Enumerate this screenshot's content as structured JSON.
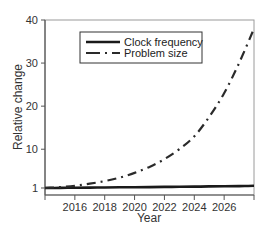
{
  "chart_data": {
    "type": "line",
    "title": "",
    "xlabel": "Year",
    "ylabel": "Relative change",
    "xlim": [
      2014,
      2028
    ],
    "ylim": [
      0,
      40
    ],
    "x_ticks": [
      "2016",
      "2018",
      "2020",
      "2022",
      "2024",
      "2026"
    ],
    "y_ticks": [
      "1",
      "10",
      "20",
      "30",
      "40"
    ],
    "grid": false,
    "legend_position": "upper left (inside)",
    "x": [
      2014,
      2015,
      2016,
      2017,
      2018,
      2019,
      2020,
      2021,
      2022,
      2023,
      2024,
      2025,
      2026,
      2027,
      2028
    ],
    "series": [
      {
        "name": "Clock frequency",
        "style": "solid",
        "values": [
          1.0,
          1.03,
          1.06,
          1.09,
          1.12,
          1.15,
          1.18,
          1.21,
          1.25,
          1.28,
          1.32,
          1.36,
          1.4,
          1.45,
          1.5
        ]
      },
      {
        "name": "Problem size",
        "style": "dash-dot",
        "values": [
          1.0,
          1.2,
          1.5,
          2.0,
          2.6,
          3.4,
          4.5,
          5.9,
          7.7,
          10.0,
          13.0,
          17.5,
          23.0,
          30.0,
          38.0
        ]
      }
    ]
  },
  "legend": {
    "items": [
      {
        "label": "Clock frequency"
      },
      {
        "label": "Problem size"
      }
    ]
  },
  "axes": {
    "xlabel": "Year",
    "ylabel": "Relative change"
  },
  "colors": {
    "line": "#222222",
    "axis": "#555555",
    "frame": "#999999"
  }
}
